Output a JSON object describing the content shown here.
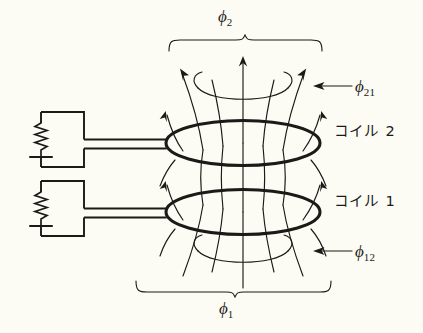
{
  "figure": {
    "background_color": "#fdfcf4",
    "ink_color": "#1a1a18",
    "width": 423,
    "height": 333
  },
  "labels": {
    "phi2": {
      "symbol": "ϕ",
      "subscript": "2",
      "position": "top-brace"
    },
    "phi1": {
      "symbol": "ϕ",
      "subscript": "1",
      "position": "bottom-brace"
    },
    "phi21": {
      "symbol": "ϕ",
      "subscript": "21",
      "position": "upper-right"
    },
    "phi12": {
      "symbol": "ϕ",
      "subscript": "12",
      "position": "lower-right"
    },
    "coil2": "コイル 2",
    "coil1": "コイル 1"
  },
  "components": {
    "coil_upper": {
      "name": "coil2",
      "cx": 243,
      "cy": 143,
      "rx": 77,
      "ry": 23
    },
    "coil_lower": {
      "name": "coil1",
      "cx": 243,
      "cy": 212,
      "rx": 77,
      "ry": 23
    },
    "source_upper": {
      "name": "source2",
      "x": 33,
      "y": 108,
      "type": "resistor-battery"
    },
    "source_lower": {
      "name": "source1",
      "x": 33,
      "y": 177,
      "type": "resistor-battery"
    },
    "brace_top": {
      "x1": 168,
      "x2": 322,
      "y": 38
    },
    "brace_bottom": {
      "x1": 135,
      "x2": 330,
      "y": 283
    }
  }
}
